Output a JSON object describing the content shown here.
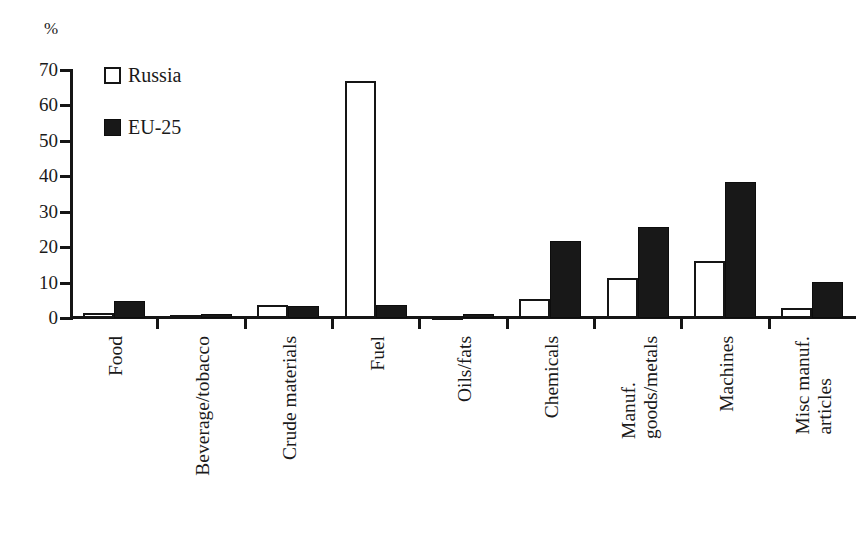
{
  "axis": {
    "y_unit": "%",
    "y_ticks": [
      0,
      10,
      20,
      30,
      40,
      50,
      60,
      70
    ]
  },
  "legend": {
    "items": [
      {
        "label": "Russia",
        "swatch": "open-square",
        "color": "#ffffff"
      },
      {
        "label": "EU-25",
        "swatch": "filled-square",
        "color": "#181818"
      }
    ]
  },
  "chart_data": {
    "type": "bar",
    "title": "",
    "xlabel": "",
    "ylabel": "%",
    "ylim": [
      0,
      70
    ],
    "grid": false,
    "legend_position": "top-left-inside",
    "categories": [
      "Food",
      "Beverage/tobacco",
      "Crude materials",
      "Fuel",
      "Oils/fats",
      "Chemicals",
      "Manuf. goods/metals",
      "Machines",
      "Misc manuf. articles"
    ],
    "category_lines": [
      [
        "Food"
      ],
      [
        "Beverage/tobacco"
      ],
      [
        "Crude materials"
      ],
      [
        "Fuel"
      ],
      [
        "Oils/fats"
      ],
      [
        "Chemicals"
      ],
      [
        "Manuf.",
        "goods/metals"
      ],
      [
        "Machines"
      ],
      [
        "Misc manuf.",
        "articles"
      ]
    ],
    "series": [
      {
        "name": "Russia",
        "color": "#ffffff",
        "values": [
          1.5,
          0.8,
          3.8,
          66.8,
          0.2,
          5.5,
          11.4,
          16.0,
          2.8
        ]
      },
      {
        "name": "EU-25",
        "color": "#181818",
        "values": [
          4.8,
          1.1,
          3.4,
          3.7,
          1.1,
          21.6,
          25.6,
          38.4,
          10.3
        ]
      }
    ]
  }
}
